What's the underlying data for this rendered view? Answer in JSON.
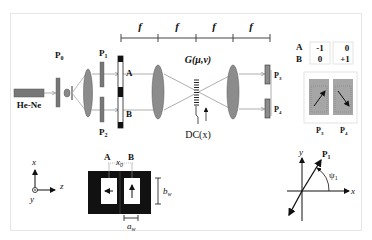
{
  "diagram": {
    "type": "optical-setup",
    "source": {
      "label": "He-Ne"
    },
    "polarizers": {
      "p0": {
        "label": "P",
        "sub": "0"
      },
      "p1_top": {
        "label": "P",
        "sub": "1"
      },
      "p2_bottom": {
        "label": "P",
        "sub": "2"
      },
      "p3": {
        "label": "P",
        "sub": "3"
      },
      "p4": {
        "label": "P",
        "sub": "4"
      }
    },
    "apertures": {
      "a": "A",
      "b": "B"
    },
    "focal_lengths": [
      "f",
      "f",
      "f",
      "f"
    ],
    "grating_label": "G(μ,ν)",
    "detector_label": "DC(x)",
    "table": {
      "rows": [
        {
          "label": "A",
          "values": [
            "-1",
            "0"
          ]
        },
        {
          "label": "B",
          "values": [
            "0",
            "+1"
          ]
        }
      ]
    },
    "detector_boxes": {
      "labels": [
        "P3",
        "P4"
      ],
      "p3": {
        "label": "P",
        "sub": "3"
      },
      "p4": {
        "label": "P",
        "sub": "4"
      }
    },
    "coords_left": {
      "x": "x",
      "y": "y",
      "z": "z"
    },
    "mask": {
      "label_a": "A",
      "label_b": "B",
      "x0": {
        "label": "x",
        "sub": "0"
      },
      "bw": {
        "label": "b",
        "sub": "w"
      },
      "aw": {
        "label": "a",
        "sub": "w"
      }
    },
    "polar_axes": {
      "x": "x",
      "y": "y",
      "p1": {
        "label": "P",
        "sub": "1"
      },
      "psi": {
        "label": "ψ",
        "sub": "1"
      }
    }
  },
  "colors": {
    "gray_fill": "#8c8c8c",
    "dark": "#111111",
    "beam": "#9a9a9a",
    "detector_fill": "#a6a6a6"
  }
}
